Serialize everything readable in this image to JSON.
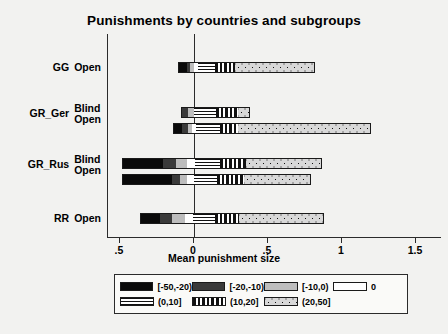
{
  "chart_data": {
    "type": "bar",
    "orientation": "horizontal",
    "stacked": true,
    "title": "Punishments by countries and subgroups",
    "xlabel": "Mean punishment size",
    "ylabel": "",
    "xlim": [
      -0.6,
      1.55
    ],
    "xticks": [
      -0.5,
      0,
      0.5,
      1,
      1.5
    ],
    "xticklabels": [
      ".5",
      "0",
      ".5",
      "1",
      "1.5"
    ],
    "grid": false,
    "zero_reference_line": 0,
    "legend_position": "below-axis",
    "categories": [
      "GG Open",
      "GR_Ger Blind",
      "GR_Ger Open",
      "GR_Rus Blind",
      "GR_Rus Open",
      "RR Open"
    ],
    "group_labels": [
      {
        "group": "GG",
        "subgroups": [
          "Open"
        ]
      },
      {
        "group": "GR_Ger",
        "subgroups": [
          "Blind",
          "Open"
        ]
      },
      {
        "group": "GR_Rus",
        "subgroups": [
          "Blind",
          "Open"
        ]
      },
      {
        "group": "RR",
        "subgroups": [
          "Open"
        ]
      }
    ],
    "series": [
      {
        "name": "[-50,-20)",
        "values": [
          -0.1,
          -0.07,
          -0.21,
          -0.33,
          -0.41,
          -0.23
        ]
      },
      {
        "name": "[-20,-10)",
        "values": [
          -0.04,
          -0.02,
          -0.08,
          -0.15,
          -0.09,
          -0.12
        ]
      },
      {
        "name": "[-10,0)",
        "values": [
          -0.07,
          -0.05,
          -0.07,
          -0.09,
          -0.05,
          -0.1
        ]
      },
      {
        "name": "0",
        "values": [
          0.02,
          0.01,
          0.04,
          0.06,
          0.05,
          0.06
        ]
      },
      {
        "name": "(0,10]",
        "values": [
          0.15,
          0.16,
          0.2,
          0.18,
          0.2,
          0.17
        ]
      },
      {
        "name": "(10,20]",
        "values": [
          0.14,
          0.16,
          0.13,
          0.19,
          0.17,
          0.16
        ]
      },
      {
        "name": "(20,50]",
        "values": [
          0.55,
          0.07,
          0.75,
          0.42,
          0.44,
          0.42
        ]
      }
    ],
    "bars": [
      {
        "category": "GG Open",
        "start": -0.1,
        "segments": [
          {
            "key": "[-50,-20)",
            "width": 0.055
          },
          {
            "key": "[-20,-10)",
            "width": 0.02
          },
          {
            "key": "[-10,0)",
            "width": 0.025
          },
          {
            "key": "0",
            "width": 0.03
          },
          {
            "key": "(0,10]",
            "width": 0.115
          },
          {
            "key": "(10,20]",
            "width": 0.135
          },
          {
            "key": "(20,50]",
            "width": 0.545
          }
        ]
      },
      {
        "category": "GR_Ger Blind",
        "start": -0.08,
        "segments": [
          {
            "key": "[-50,-20)",
            "width": 0.0
          },
          {
            "key": "[-20,-10)",
            "width": 0.04
          },
          {
            "key": "[-10,0)",
            "width": 0.04
          },
          {
            "key": "0",
            "width": 0.0
          },
          {
            "key": "(0,10]",
            "width": 0.155
          },
          {
            "key": "(10,20]",
            "width": 0.155
          },
          {
            "key": "(20,50]",
            "width": 0.075
          }
        ]
      },
      {
        "category": "GR_Ger Open",
        "start": -0.135,
        "segments": [
          {
            "key": "[-50,-20)",
            "width": 0.055
          },
          {
            "key": "[-20,-10)",
            "width": 0.04
          },
          {
            "key": "[-10,0)",
            "width": 0.025
          },
          {
            "key": "0",
            "width": 0.03
          },
          {
            "key": "(0,10]",
            "width": 0.165
          },
          {
            "key": "(10,20]",
            "width": 0.125
          },
          {
            "key": "(20,50]",
            "width": 0.9
          }
        ]
      },
      {
        "category": "GR_Rus Blind",
        "start": -0.48,
        "segments": [
          {
            "key": "[-50,-20)",
            "width": 0.27
          },
          {
            "key": "[-20,-10)",
            "width": 0.095
          },
          {
            "key": "[-10,0)",
            "width": 0.075
          },
          {
            "key": "0",
            "width": 0.05
          },
          {
            "key": "(0,10]",
            "width": 0.175
          },
          {
            "key": "(10,20]",
            "width": 0.175
          },
          {
            "key": "(20,50]",
            "width": 0.51
          }
        ]
      },
      {
        "category": "GR_Rus Open",
        "start": -0.48,
        "segments": [
          {
            "key": "[-50,-20)",
            "width": 0.335
          },
          {
            "key": "[-20,-10)",
            "width": 0.055
          },
          {
            "key": "[-10,0)",
            "width": 0.045
          },
          {
            "key": "0",
            "width": 0.05
          },
          {
            "key": "(0,10]",
            "width": 0.16
          },
          {
            "key": "(10,20]",
            "width": 0.18
          },
          {
            "key": "(20,50]",
            "width": 0.455
          }
        ]
      },
      {
        "category": "RR Open",
        "start": -0.355,
        "segments": [
          {
            "key": "[-50,-20)",
            "width": 0.13
          },
          {
            "key": "[-20,-10)",
            "width": 0.08
          },
          {
            "key": "[-10,0)",
            "width": 0.085
          },
          {
            "key": "0",
            "width": 0.055
          },
          {
            "key": "(0,10]",
            "width": 0.155
          },
          {
            "key": "(10,20]",
            "width": 0.16
          },
          {
            "key": "(20,50]",
            "width": 0.575
          }
        ]
      }
    ],
    "legend": [
      {
        "label": "[-50,-20)",
        "pattern": "solid-black",
        "color": "#0a0a0a"
      },
      {
        "label": "[-20,-10)",
        "pattern": "solid-dark-gray",
        "color": "#3a3a3a"
      },
      {
        "label": "[-10,0)",
        "pattern": "solid-light-gray",
        "color": "#bdbdbd"
      },
      {
        "label": "0",
        "pattern": "empty-white",
        "color": "#ffffff"
      },
      {
        "label": "(0,10]",
        "pattern": "horizontal-lines",
        "color": "#111111"
      },
      {
        "label": "(10,20]",
        "pattern": "vertical-stripes",
        "color": "#111111"
      },
      {
        "label": "(20,50]",
        "pattern": "dotted",
        "color": "#d8d8d8"
      }
    ]
  }
}
